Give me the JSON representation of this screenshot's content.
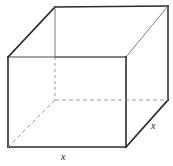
{
  "figure": {
    "shape": "cube",
    "labels": {
      "bottom_edge": "x",
      "right_edge": "x"
    },
    "colors": {
      "background": "#ffffff",
      "visible_edge": "#2b2b2b",
      "secondary_edge": "#6b6b6b",
      "hidden_edge": "#8c8c8c",
      "label_text": "#1a1a1a"
    },
    "stroke_widths": {
      "visible_edge": 1.6,
      "secondary_edge": 0.9,
      "hidden_edge": 0.9
    },
    "dash_pattern": "4,3",
    "vertices": {
      "front_top_left": [
        8,
        57
      ],
      "front_top_right": [
        126,
        57
      ],
      "front_bottom_right": [
        126,
        147
      ],
      "front_bottom_left": [
        8,
        147
      ],
      "back_top_left": [
        55,
        7
      ],
      "back_top_right": [
        168,
        6
      ],
      "back_bottom_right": [
        168,
        100
      ],
      "back_bottom_left": [
        55,
        100
      ]
    },
    "edges": [
      {
        "name": "front-top",
        "from": "front_top_left",
        "to": "front_top_right",
        "style": "solid"
      },
      {
        "name": "front-right",
        "from": "front_top_right",
        "to": "front_bottom_right",
        "style": "solid"
      },
      {
        "name": "front-bottom",
        "from": "front_bottom_right",
        "to": "front_bottom_left",
        "style": "solid"
      },
      {
        "name": "front-left",
        "from": "front_bottom_left",
        "to": "front_top_left",
        "style": "solid"
      },
      {
        "name": "back-top",
        "from": "back_top_left",
        "to": "back_top_right",
        "style": "solid"
      },
      {
        "name": "back-right",
        "from": "back_top_right",
        "to": "back_bottom_right",
        "style": "solid"
      },
      {
        "name": "top-left-diagonal",
        "from": "front_top_left",
        "to": "back_top_left",
        "style": "solid"
      },
      {
        "name": "top-right-diagonal",
        "from": "front_top_right",
        "to": "back_top_right",
        "style": "solid"
      },
      {
        "name": "bottom-right-diagonal",
        "from": "front_bottom_right",
        "to": "back_bottom_right",
        "style": "solid"
      },
      {
        "name": "back-left-upper",
        "from": "back_top_left",
        "to": "front_top_left_level",
        "style": "solid-thin"
      },
      {
        "name": "back-left-hidden",
        "from": "back_top_left_level",
        "to": "back_bottom_left",
        "style": "dashed"
      },
      {
        "name": "back-bottom-hidden",
        "from": "back_bottom_left",
        "to": "back_bottom_right",
        "style": "dashed"
      },
      {
        "name": "bottom-left-diagonal-hidden",
        "from": "back_bottom_left",
        "to": "front_bottom_left",
        "style": "dashed"
      }
    ]
  }
}
